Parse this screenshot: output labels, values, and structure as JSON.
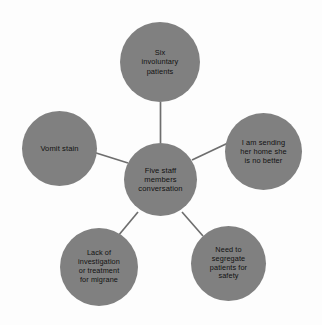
{
  "diagram": {
    "type": "hub-and-spoke",
    "node_fill_color": "#808080",
    "text_color": "#111111",
    "connector_color": "#6e6e6e",
    "background_color": "#fdfdfd",
    "center": {
      "id": "five-staff-members-conversation",
      "label": "Five staff\nmembers\nconversation"
    },
    "satellites": [
      {
        "id": "six-involuntary-patients",
        "position": "top",
        "label": "Six\ninvoluntary\npatients"
      },
      {
        "id": "i-am-sending-her-home-she-is-no-better",
        "position": "right",
        "label": "I am sending\nher home she\nis no better"
      },
      {
        "id": "need-to-segregate-patients-for-safety",
        "position": "bottom-right",
        "label": "Need to\nsegregate\npatients  for\nsafety"
      },
      {
        "id": "lack-of-investigation-or-treatment-for-migrane",
        "position": "bottom-left",
        "label": "Lack of\ninvestigation\nor treatment\nfor migrane"
      },
      {
        "id": "vomit-stain",
        "position": "left",
        "label": "Vomit stain"
      }
    ],
    "connections": [
      {
        "from": "five-staff-members-conversation",
        "to": "six-involuntary-patients"
      },
      {
        "from": "five-staff-members-conversation",
        "to": "i-am-sending-her-home-she-is-no-better"
      },
      {
        "from": "five-staff-members-conversation",
        "to": "need-to-segregate-patients-for-safety"
      },
      {
        "from": "five-staff-members-conversation",
        "to": "lack-of-investigation-or-treatment-for-migrane"
      },
      {
        "from": "five-staff-members-conversation",
        "to": "vomit-stain"
      }
    ]
  }
}
